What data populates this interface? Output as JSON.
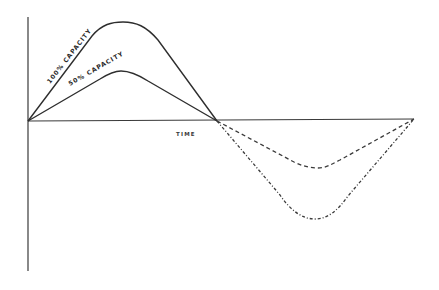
{
  "diagram": {
    "labels": {
      "full_capacity": "100% CAPACITY",
      "half_capacity": "50% CAPACITY",
      "x_axis": "TIME"
    },
    "colors": {
      "line": "#2e2e2e",
      "axis": "#3a3a3a",
      "background": "#ffffff"
    },
    "curves": [
      {
        "name": "100% capacity (positive half-cycle)",
        "style": "solid",
        "start": [
          28,
          121
        ],
        "peak": [
          123,
          23
        ],
        "end": [
          217,
          121
        ]
      },
      {
        "name": "50% capacity (positive half-cycle)",
        "style": "solid",
        "start": [
          28,
          121
        ],
        "peak": [
          121,
          71
        ],
        "end": [
          217,
          121
        ]
      },
      {
        "name": "50% capacity (negative half-cycle)",
        "style": "dashed",
        "start": [
          217,
          121
        ],
        "trough": [
          318,
          168
        ],
        "end": [
          414,
          119
        ]
      },
      {
        "name": "100% capacity (negative half-cycle)",
        "style": "dashed",
        "start": [
          217,
          121
        ],
        "trough": [
          315,
          219
        ],
        "end": [
          414,
          119
        ]
      }
    ]
  }
}
